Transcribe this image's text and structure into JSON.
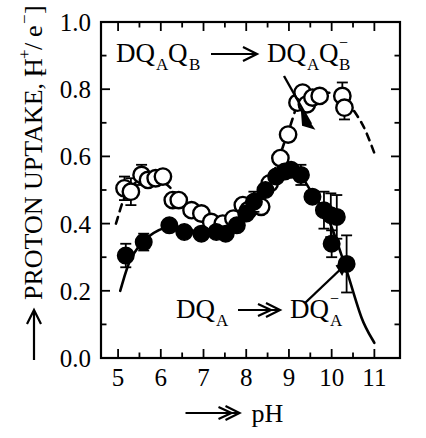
{
  "figure": {
    "background": "#ffffff",
    "ink": "#000000",
    "ylabel": "PROTON UPTAKE,  [H /e ]",
    "ylabel_parts": {
      "arrow": "⟶",
      "main": "PROTON UPTAKE,",
      "bracket_open": "[",
      "H": "H",
      "H_sup": "+",
      "slash": "/",
      "e": "e",
      "e_sup": "−",
      "bracket_close": "]"
    },
    "xlabel_parts": {
      "arrow": "⟶",
      "text": "pH"
    },
    "annotation_top": {
      "left": "DQ",
      "left_subA": "A",
      "left_Q": "Q",
      "left_subB": "B",
      "arrow": "⟶",
      "right": "DQ",
      "right_subA": "A",
      "right_Q": "Q",
      "right_supminus": "−",
      "right_subB": "B",
      "full_text": "DQ_A Q_B ⟶ DQ_A Q_B^-"
    },
    "annotation_bottom": {
      "left": "DQ",
      "left_subA": "A",
      "arrow": "⟶",
      "right": "DQ",
      "right_supminus": "−",
      "right_subA": "A",
      "full_text": "DQ_A ⟶ DQ_A^-"
    }
  },
  "chart_data": {
    "type": "scatter",
    "title": "",
    "xlabel": "pH",
    "ylabel": "PROTON UPTAKE, [H+/e-]",
    "xlim": [
      4.6,
      11.6
    ],
    "ylim": [
      0.0,
      1.0
    ],
    "xticks": [
      5,
      6,
      7,
      8,
      9,
      10,
      11
    ],
    "xticklabels": [
      "5",
      "6",
      "7",
      "8",
      "9",
      "10",
      "11"
    ],
    "xminor_step": 0.5,
    "yticks": [
      0.0,
      0.2,
      0.4,
      0.6,
      0.8,
      1.0
    ],
    "yticklabels": [
      "0.0",
      "0.2",
      "0.4",
      "0.6",
      "0.8",
      "1.0"
    ],
    "yminor_step": 0.1,
    "grid": false,
    "legend": "none",
    "frame": "box",
    "series": [
      {
        "name": "DQ_A Q_B → DQ_A Q_B^-",
        "marker": "open-circle",
        "fit_line": "dashed",
        "points": [
          {
            "x": 5.15,
            "y": 0.505,
            "err": 0.035
          },
          {
            "x": 5.3,
            "y": 0.495,
            "err": 0.04
          },
          {
            "x": 5.55,
            "y": 0.545,
            "err": 0.03
          },
          {
            "x": 5.7,
            "y": 0.53,
            "err": 0.0
          },
          {
            "x": 5.88,
            "y": 0.535,
            "err": 0.0
          },
          {
            "x": 6.05,
            "y": 0.54,
            "err": 0.0
          },
          {
            "x": 6.28,
            "y": 0.47,
            "err": 0.0
          },
          {
            "x": 6.42,
            "y": 0.47,
            "err": 0.0
          },
          {
            "x": 6.72,
            "y": 0.44,
            "err": 0.0
          },
          {
            "x": 6.95,
            "y": 0.43,
            "err": 0.0
          },
          {
            "x": 7.18,
            "y": 0.405,
            "err": 0.0
          },
          {
            "x": 7.45,
            "y": 0.4,
            "err": 0.0
          },
          {
            "x": 7.7,
            "y": 0.415,
            "err": 0.0
          },
          {
            "x": 7.92,
            "y": 0.455,
            "err": 0.0
          },
          {
            "x": 8.05,
            "y": 0.44,
            "err": 0.0
          },
          {
            "x": 8.22,
            "y": 0.465,
            "err": 0.0
          },
          {
            "x": 8.35,
            "y": 0.45,
            "err": 0.0
          },
          {
            "x": 8.55,
            "y": 0.52,
            "err": 0.0
          },
          {
            "x": 8.8,
            "y": 0.595,
            "err": 0.0
          },
          {
            "x": 8.98,
            "y": 0.665,
            "err": 0.0
          },
          {
            "x": 9.2,
            "y": 0.76,
            "err": 0.0
          },
          {
            "x": 9.32,
            "y": 0.79,
            "err": 0.0
          },
          {
            "x": 9.42,
            "y": 0.755,
            "err": 0.0
          },
          {
            "x": 9.55,
            "y": 0.775,
            "err": 0.0
          },
          {
            "x": 9.72,
            "y": 0.78,
            "err": 0.0
          },
          {
            "x": 10.25,
            "y": 0.78,
            "err": 0.04
          },
          {
            "x": 10.3,
            "y": 0.745,
            "err": 0.035
          }
        ]
      },
      {
        "name": "DQ_A → DQ_A^-",
        "marker": "filled-circle",
        "fit_line": "solid",
        "points": [
          {
            "x": 5.18,
            "y": 0.305,
            "err": 0.035
          },
          {
            "x": 5.6,
            "y": 0.345,
            "err": 0.025
          },
          {
            "x": 6.2,
            "y": 0.395,
            "err": 0.0
          },
          {
            "x": 6.55,
            "y": 0.375,
            "err": 0.0
          },
          {
            "x": 6.95,
            "y": 0.37,
            "err": 0.0
          },
          {
            "x": 7.3,
            "y": 0.375,
            "err": 0.0
          },
          {
            "x": 7.52,
            "y": 0.37,
            "err": 0.0
          },
          {
            "x": 7.78,
            "y": 0.395,
            "err": 0.0
          },
          {
            "x": 8.0,
            "y": 0.43,
            "err": 0.0
          },
          {
            "x": 8.18,
            "y": 0.465,
            "err": 0.03
          },
          {
            "x": 8.45,
            "y": 0.5,
            "err": 0.0
          },
          {
            "x": 8.7,
            "y": 0.54,
            "err": 0.0
          },
          {
            "x": 8.9,
            "y": 0.555,
            "err": 0.0
          },
          {
            "x": 9.05,
            "y": 0.56,
            "err": 0.0
          },
          {
            "x": 9.28,
            "y": 0.545,
            "err": 0.03
          },
          {
            "x": 9.55,
            "y": 0.48,
            "err": 0.0
          },
          {
            "x": 9.82,
            "y": 0.44,
            "err": 0.055
          },
          {
            "x": 9.98,
            "y": 0.425,
            "err": 0.065
          },
          {
            "x": 10.12,
            "y": 0.42,
            "err": 0.065
          },
          {
            "x": 10.0,
            "y": 0.34,
            "err": 0.04
          },
          {
            "x": 10.35,
            "y": 0.28,
            "err": 0.085
          }
        ]
      }
    ],
    "curves": [
      {
        "name": "solid-fit-DQA",
        "style": "solid",
        "points": [
          {
            "x": 5.05,
            "y": 0.2
          },
          {
            "x": 5.3,
            "y": 0.295
          },
          {
            "x": 5.7,
            "y": 0.36
          },
          {
            "x": 6.2,
            "y": 0.39
          },
          {
            "x": 6.8,
            "y": 0.378
          },
          {
            "x": 7.4,
            "y": 0.372
          },
          {
            "x": 7.9,
            "y": 0.4
          },
          {
            "x": 8.4,
            "y": 0.49
          },
          {
            "x": 8.9,
            "y": 0.555
          },
          {
            "x": 9.2,
            "y": 0.555
          },
          {
            "x": 9.5,
            "y": 0.5
          },
          {
            "x": 9.9,
            "y": 0.42
          },
          {
            "x": 10.3,
            "y": 0.28
          },
          {
            "x": 10.7,
            "y": 0.12
          },
          {
            "x": 11.0,
            "y": 0.045
          }
        ]
      },
      {
        "name": "dashed-fit-DQAQB",
        "style": "dashed",
        "points": [
          {
            "x": 4.95,
            "y": 0.4
          },
          {
            "x": 5.2,
            "y": 0.49
          },
          {
            "x": 5.6,
            "y": 0.535
          },
          {
            "x": 6.1,
            "y": 0.52
          },
          {
            "x": 6.6,
            "y": 0.455
          },
          {
            "x": 7.2,
            "y": 0.41
          },
          {
            "x": 7.7,
            "y": 0.415
          },
          {
            "x": 8.2,
            "y": 0.46
          },
          {
            "x": 8.6,
            "y": 0.54
          },
          {
            "x": 9.0,
            "y": 0.68
          },
          {
            "x": 9.3,
            "y": 0.775
          },
          {
            "x": 9.8,
            "y": 0.79
          },
          {
            "x": 10.25,
            "y": 0.775
          },
          {
            "x": 10.7,
            "y": 0.7
          },
          {
            "x": 11.0,
            "y": 0.61
          }
        ]
      }
    ]
  }
}
